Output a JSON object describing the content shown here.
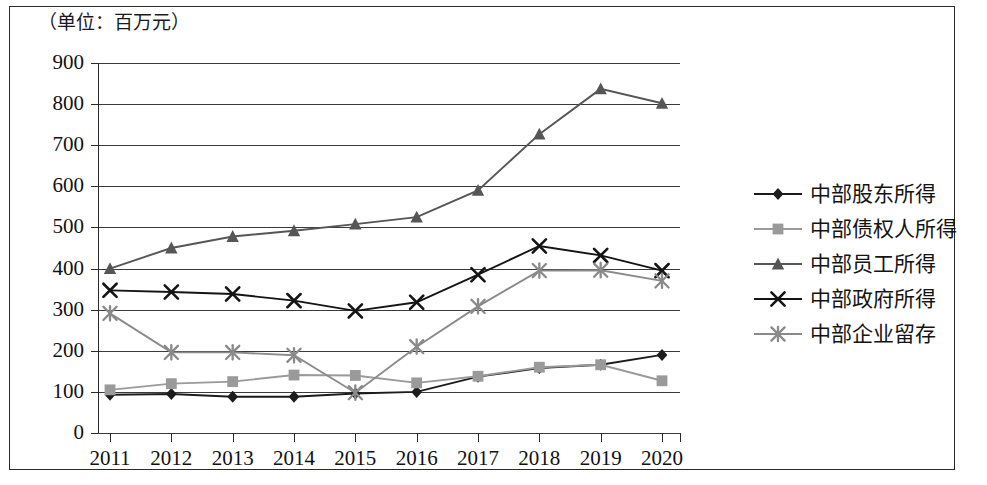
{
  "unit_label": "（单位：百万元）",
  "legend": {
    "position": "right",
    "items": [
      {
        "label": "中部股东所得",
        "marker": "diamond",
        "color": "#1c1c1c"
      },
      {
        "label": "中部债权人所得",
        "marker": "square",
        "color": "#9a9a9a"
      },
      {
        "label": "中部员工所得",
        "marker": "triangle",
        "color": "#565656"
      },
      {
        "label": "中部政府所得",
        "marker": "x-cross",
        "color": "#141414"
      },
      {
        "label": "中部企业留存",
        "marker": "asterisk",
        "color": "#8a8a8a"
      }
    ]
  },
  "chart_data": {
    "type": "line",
    "title": "",
    "subtitle": "",
    "xlabel": "",
    "ylabel": "（单位：百万元）",
    "grid": true,
    "legend_position": "right",
    "categories": [
      "2011",
      "2012",
      "2013",
      "2014",
      "2015",
      "2016",
      "2017",
      "2018",
      "2019",
      "2020"
    ],
    "x_tick_labels": [
      "2011",
      "2012",
      "2013",
      "2014",
      "2015",
      "2016",
      "2017",
      "2018",
      "2019",
      "2020"
    ],
    "y_tick_labels": [
      "0",
      "100",
      "200",
      "300",
      "400",
      "500",
      "600",
      "700",
      "800",
      "900"
    ],
    "ylim": [
      0,
      900
    ],
    "y_tick_step": 100,
    "series": [
      {
        "name": "中部股东所得",
        "marker": "diamond",
        "color": "#1c1c1c",
        "values": [
          93,
          95,
          88,
          88,
          96,
          100,
          137,
          158,
          166,
          190
        ]
      },
      {
        "name": "中部债权人所得",
        "marker": "square",
        "color": "#9a9a9a",
        "values": [
          105,
          120,
          125,
          141,
          140,
          122,
          138,
          160,
          166,
          127
        ]
      },
      {
        "name": "中部员工所得",
        "marker": "triangle",
        "color": "#565656",
        "values": [
          400,
          450,
          478,
          492,
          508,
          525,
          590,
          727,
          837,
          802
        ]
      },
      {
        "name": "中部政府所得",
        "marker": "x-cross",
        "color": "#141414",
        "values": [
          347,
          343,
          338,
          322,
          297,
          318,
          385,
          455,
          432,
          395
        ]
      },
      {
        "name": "中部企业留存",
        "marker": "asterisk",
        "color": "#8a8a8a",
        "values": [
          291,
          196,
          196,
          189,
          98,
          210,
          308,
          395,
          396,
          370
        ]
      }
    ]
  }
}
